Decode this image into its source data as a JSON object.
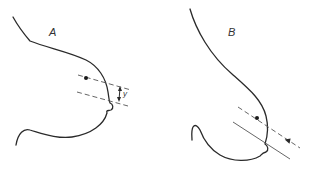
{
  "figure": {
    "panels": [
      {
        "id": "A",
        "label": "A",
        "measurement_label": "y",
        "elements": [
          "breast-outline",
          "dashed-beam-line-upper",
          "dashed-beam-line-lower",
          "focus-dot",
          "double-arrow-y"
        ]
      },
      {
        "id": "B",
        "label": "B",
        "elements": [
          "breast-outline",
          "dashed-beam-line-upper",
          "beam-line-lower",
          "focus-dot",
          "direction-arrow"
        ]
      }
    ],
    "colors": {
      "stroke": "#2a2a2a",
      "guide": "#555555",
      "background": "#ffffff"
    }
  }
}
